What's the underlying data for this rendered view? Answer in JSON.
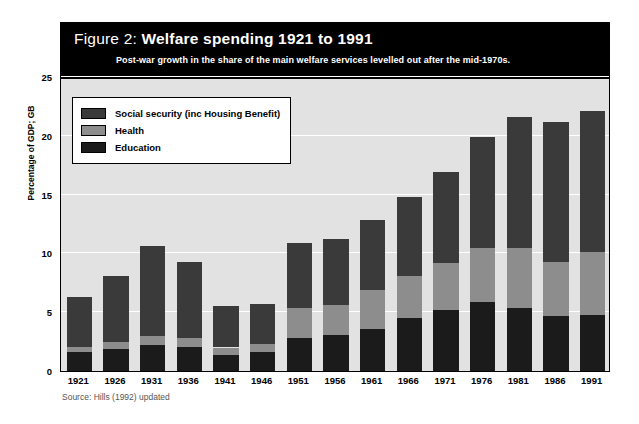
{
  "title": {
    "prefix": "Figure 2: ",
    "main": "Welfare spending 1921 to 1991",
    "subtitle": "Post-war growth in the share of the main welfare services levelled out after the mid-1970s."
  },
  "source": "Source: Hills (1992) updated",
  "legend": {
    "items": [
      {
        "label": "Social security (inc Housing Benefit)",
        "color": "#3a3a3a",
        "key": "social_security"
      },
      {
        "label": "Health",
        "color": "#8d8d8d",
        "key": "health"
      },
      {
        "label": "Education",
        "color": "#1b1b1b",
        "key": "education"
      }
    ]
  },
  "chart_data": {
    "type": "bar",
    "stacked": true,
    "title": "Welfare spending 1921 to 1991",
    "subtitle": "Post-war growth in the share of the main welfare services levelled out after the mid-1970s.",
    "xlabel": "",
    "ylabel": "Percentage of GDP; GB",
    "ylim": [
      0,
      25
    ],
    "yticks": [
      0,
      5,
      10,
      15,
      20,
      25
    ],
    "ytick_labels": [
      "0",
      "5",
      "10",
      "15",
      "20",
      "25"
    ],
    "grid": true,
    "legend_position": "inside-top-left",
    "categories": [
      "1921",
      "1926",
      "1931",
      "1936",
      "1941",
      "1946",
      "1951",
      "1956",
      "1961",
      "1966",
      "1971",
      "1976",
      "1981",
      "1986",
      "1991"
    ],
    "series": [
      {
        "name": "Education",
        "color": "#1b1b1b",
        "values": [
          1.6,
          1.9,
          2.2,
          2.0,
          1.4,
          1.6,
          2.8,
          3.1,
          3.6,
          4.5,
          5.2,
          5.9,
          5.4,
          4.7,
          4.8
        ]
      },
      {
        "name": "Health",
        "color": "#8d8d8d",
        "values": [
          0.4,
          0.6,
          0.8,
          0.8,
          0.6,
          0.7,
          2.6,
          2.5,
          3.3,
          3.6,
          4.0,
          4.6,
          5.1,
          4.6,
          5.3
        ]
      },
      {
        "name": "Social security (inc Housing Benefit)",
        "color": "#3a3a3a",
        "values": [
          4.3,
          5.6,
          7.6,
          6.5,
          3.5,
          3.4,
          5.5,
          5.6,
          5.9,
          6.7,
          7.7,
          9.4,
          11.1,
          11.9,
          12.0
        ]
      }
    ],
    "totals": [
      6.3,
      8.1,
      10.6,
      9.3,
      5.5,
      5.7,
      10.9,
      11.2,
      12.8,
      14.8,
      16.9,
      19.9,
      21.6,
      21.2,
      22.1
    ]
  }
}
